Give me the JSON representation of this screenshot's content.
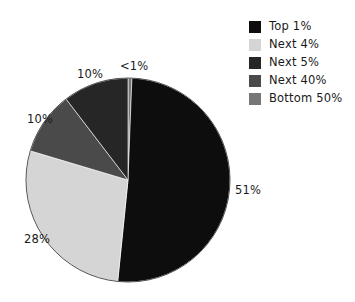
{
  "chart_data": {
    "type": "pie",
    "title": "",
    "subtitle": "",
    "xlabel": "",
    "ylabel": "",
    "grid": false,
    "legend_position": "top-right",
    "start_angle_deg": 0,
    "direction": "clockwise",
    "categories": [
      "Top 1%",
      "Next 4%",
      "Next 5%",
      "Next 40%",
      "Bottom 50%"
    ],
    "values": [
      51,
      28,
      10,
      10,
      0.5
    ],
    "value_labels": [
      "51%",
      "28%",
      "10%",
      "10%",
      "<1%"
    ],
    "colors": [
      "#0d0d0d",
      "#d5d5d5",
      "#262626",
      "#4a4a4a",
      "#767676"
    ],
    "slices": [
      {
        "name": "Bottom 50%",
        "label": "<1%",
        "value": 0.5,
        "color": "#767676",
        "start_deg": 0,
        "end_deg": 2.2
      },
      {
        "name": "Top 1%",
        "label": "51%",
        "value": 51,
        "color": "#0d0d0d",
        "start_deg": 2.2,
        "end_deg": 185.8
      },
      {
        "name": "Next 4%",
        "label": "28%",
        "value": 28,
        "color": "#d5d5d5",
        "start_deg": 185.8,
        "end_deg": 286.6
      },
      {
        "name": "Next 40%",
        "label": "10%",
        "value": 10,
        "color": "#4a4a4a",
        "start_deg": 286.6,
        "end_deg": 322.6
      },
      {
        "name": "Next 5%",
        "label": "10%",
        "value": 10,
        "color": "#262626",
        "start_deg": 322.6,
        "end_deg": 360
      }
    ]
  },
  "pie": {
    "labels": {
      "top1": "51%",
      "next4": "28%",
      "next40": "10%",
      "next5": "10%",
      "bottom50": "<1%"
    }
  },
  "legend": {
    "items": [
      {
        "label": "Top 1%",
        "color": "#0d0d0d"
      },
      {
        "label": "Next 4%",
        "color": "#d5d5d5"
      },
      {
        "label": "Next 5%",
        "color": "#262626"
      },
      {
        "label": "Next 40%",
        "color": "#4a4a4a"
      },
      {
        "label": "Bottom 50%",
        "color": "#767676"
      }
    ]
  }
}
